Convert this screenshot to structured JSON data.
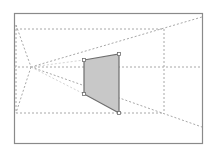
{
  "diagram": {
    "title": "",
    "type": "perspective-construction",
    "frame": {
      "x": 14,
      "y": 13,
      "width": 188,
      "height": 130,
      "stroke": "#8a8a8a"
    },
    "vanishing_point": {
      "x": 31,
      "y": 67
    },
    "quad": {
      "points": [
        [
          84,
          60
        ],
        [
          119,
          54
        ],
        [
          119,
          113
        ],
        [
          84,
          94
        ]
      ],
      "fill": "#c8c8c8",
      "stroke": "#6e6e6e",
      "handle_fill": "#ffffff"
    },
    "guide_color": "#a8a8a8",
    "guide_light_color": "#d4d4d4",
    "guides": {
      "horizontal": [
        {
          "x1": 16,
          "y1": 29,
          "x2": 164,
          "y2": 29
        },
        {
          "x1": 14,
          "y1": 67,
          "x2": 202,
          "y2": 67
        },
        {
          "x1": 16,
          "y1": 113,
          "x2": 164,
          "y2": 113
        }
      ],
      "vertical": [
        {
          "x1": 16,
          "y1": 25,
          "x2": 16,
          "y2": 113
        },
        {
          "x1": 164,
          "y1": 29,
          "x2": 164,
          "y2": 113
        }
      ],
      "rays": [
        {
          "x1": 31,
          "y1": 67,
          "x2": 202,
          "y2": 17,
          "light": false
        },
        {
          "x1": 31,
          "y1": 67,
          "x2": 202,
          "y2": 127,
          "light": false
        },
        {
          "x1": 31,
          "y1": 67,
          "x2": 84,
          "y2": 60,
          "light": true
        },
        {
          "x1": 31,
          "y1": 67,
          "x2": 84,
          "y2": 94,
          "light": true
        },
        {
          "x1": 16,
          "y1": 25,
          "x2": 31,
          "y2": 67,
          "light": false
        },
        {
          "x1": 31,
          "y1": 67,
          "x2": 16,
          "y2": 113,
          "light": false
        }
      ]
    }
  }
}
